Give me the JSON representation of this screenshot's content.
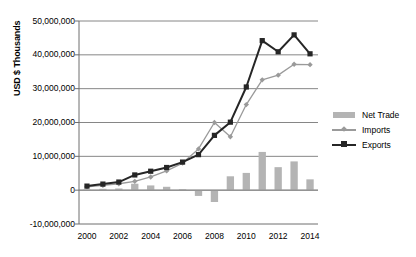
{
  "chart_data": {
    "type": "bar",
    "title": "",
    "subtitle": "",
    "xlabel": "",
    "ylabel": "USD $ Thousands",
    "categories": [
      "2000",
      "2001",
      "2002",
      "2003",
      "2004",
      "2005",
      "2006",
      "2007",
      "2008",
      "2009",
      "2010",
      "2011",
      "2012",
      "2013",
      "2014"
    ],
    "x_tick_labels": [
      "2000",
      "2002",
      "2004",
      "2006",
      "2008",
      "2010",
      "2012",
      "2014"
    ],
    "y_tick_labels": [
      "50,000,000",
      "40,000,000",
      "30,000,000",
      "20,000,000",
      "10,000,000",
      "0",
      "-10,000,000"
    ],
    "y_tick_values": [
      50000000,
      40000000,
      30000000,
      20000000,
      10000000,
      0,
      -10000000
    ],
    "ylim": [
      -10000000,
      50000000
    ],
    "grid": "horizontal",
    "legend_position": "right",
    "series": [
      {
        "name": "Net Trade",
        "type": "bar",
        "color": "#b4b4b4",
        "values": [
          200000,
          400000,
          500000,
          1900000,
          1400000,
          1000000,
          300000,
          -1700000,
          -3500000,
          4100000,
          5100000,
          11300000,
          6800000,
          8500000,
          3200000
        ]
      },
      {
        "name": "Imports",
        "type": "line",
        "color": "#9a9a9a",
        "marker": "diamond",
        "values": [
          1000000,
          1400000,
          1900000,
          2600000,
          3900000,
          5700000,
          8000000,
          12200000,
          20000000,
          15800000,
          25300000,
          32600000,
          34000000,
          37200000,
          37100000
        ]
      },
      {
        "name": "Exports",
        "type": "line",
        "color": "#262626",
        "marker": "square",
        "values": [
          1200000,
          1800000,
          2400000,
          4500000,
          5600000,
          6700000,
          8300000,
          10500000,
          16200000,
          20100000,
          30500000,
          44200000,
          40900000,
          45900000,
          40300000
        ]
      }
    ]
  },
  "legend": {
    "items": [
      {
        "label": "Net Trade"
      },
      {
        "label": "Imports"
      },
      {
        "label": "Exports"
      }
    ]
  },
  "colors": {
    "bar": "#b4b4b4",
    "imports": "#9a9a9a",
    "exports": "#262626",
    "grid": "#868686",
    "axis": "#6e6e6e",
    "background": "#ffffff"
  }
}
